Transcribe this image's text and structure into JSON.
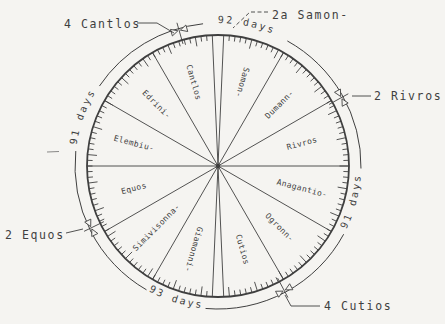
{
  "page": {
    "background": "#f5f4f1",
    "ink": "#3f3f3f"
  },
  "wheel": {
    "months": [
      {
        "name": "Samon-"
      },
      {
        "name": "Dumann-"
      },
      {
        "name": "Rivros"
      },
      {
        "name": "Anagantio-"
      },
      {
        "name": "Ogronn-"
      },
      {
        "name": "Cutios"
      },
      {
        "name": "Giamonni-"
      },
      {
        "name": "Simivisonna-"
      },
      {
        "name": "Equos"
      },
      {
        "name": "Elembiu-"
      },
      {
        "name": "Edrini-"
      },
      {
        "name": "Cantlos"
      }
    ],
    "quarters": [
      {
        "label": "92 days",
        "position": "top"
      },
      {
        "label": "91 days",
        "position": "right"
      },
      {
        "label": "93 days",
        "position": "bottom"
      },
      {
        "label": "91 days",
        "position": "left"
      }
    ],
    "callouts": [
      {
        "label": "4 Cantlos"
      },
      {
        "label": "2a Samon-"
      },
      {
        "label": "2 Rivros"
      },
      {
        "label": "2 Equos"
      },
      {
        "label": "4 Cutios"
      }
    ]
  }
}
